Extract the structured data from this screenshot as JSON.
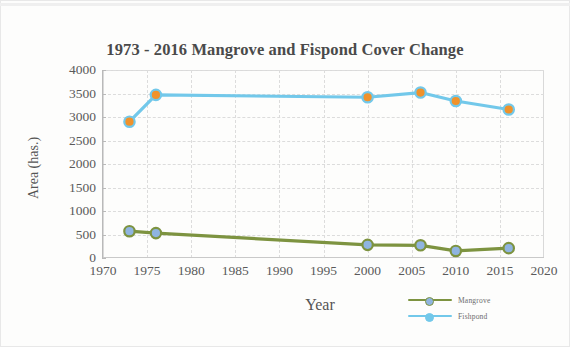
{
  "chart_data": {
    "type": "line",
    "title": "1973 - 2016 Mangrove and Fispond Cover Change",
    "xlabel": "Year",
    "ylabel": "Area (has.)",
    "xlim": [
      1970,
      2020
    ],
    "ylim": [
      0,
      4000
    ],
    "xticks": [
      1970,
      1975,
      1980,
      1985,
      1990,
      1995,
      2000,
      2005,
      2010,
      2015,
      2020
    ],
    "xtick_labels": [
      "1970",
      "1975",
      "1980",
      "1985",
      "1990",
      "1995",
      "2000",
      "2005",
      "2010",
      "2015",
      "2020"
    ],
    "yticks": [
      0,
      500,
      1000,
      1500,
      2000,
      2500,
      3000,
      3500,
      4000
    ],
    "ytick_labels": [
      "0",
      "500",
      "1000",
      "1500",
      "2000",
      "2500",
      "3000",
      "3500",
      "4000"
    ],
    "grid": true,
    "legend_position": "bottom-right",
    "x": [
      1973,
      1976,
      2000,
      2006,
      2010,
      2016
    ],
    "series": [
      {
        "name": "Mangrove",
        "values": [
          570,
          530,
          280,
          270,
          150,
          210
        ],
        "line_color": "#7d9340",
        "marker_fill": "#8fb4e0",
        "marker_edge": "#7d9340"
      },
      {
        "name": "Fishpond",
        "values": [
          2900,
          3470,
          3420,
          3520,
          3340,
          3160
        ],
        "line_color": "#72c8ea",
        "marker_fill": "#f0922b",
        "marker_edge": "#72c8ea"
      }
    ]
  },
  "legend": {
    "items": [
      {
        "label": "Mangrove"
      },
      {
        "label": "Fishpond"
      }
    ]
  },
  "colors": {
    "mangrove_line": "#7d9340",
    "fishpond_line": "#72c8ea",
    "mangrove_marker": "#8fb4e0",
    "fishpond_marker": "#f0922b",
    "axis": "#b9b9b9",
    "grid": "#dcdcdc",
    "text": "#5a5a5a",
    "title_text": "#4a4a4a"
  }
}
